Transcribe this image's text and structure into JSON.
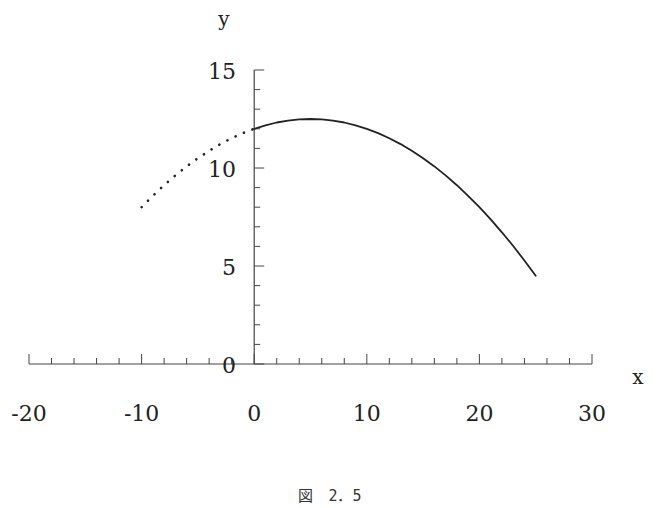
{
  "chart_data": {
    "type": "line",
    "title": "",
    "caption": "図　2．5",
    "xlabel": "x",
    "ylabel": "y",
    "xlim": [
      -20,
      30
    ],
    "ylim": [
      0,
      15
    ],
    "x_major_ticks": [
      -20,
      -10,
      0,
      10,
      20,
      30
    ],
    "x_tick_labels": [
      "-20",
      "-10",
      "0",
      "10",
      "20",
      "30"
    ],
    "x_minor_step": 2,
    "y_major_ticks": [
      0,
      5,
      10,
      15
    ],
    "y_tick_labels": [
      "0",
      "5",
      "10",
      "15"
    ],
    "y_minor_step": 1,
    "grid": false,
    "legend": "none",
    "series": [
      {
        "name": "dotted-extension",
        "style": "dotted",
        "color": "#222222",
        "x": [
          -10,
          -9,
          -8,
          -7,
          -6,
          -5,
          -4,
          -3,
          -2,
          -1,
          0
        ],
        "y": [
          8.0,
          8.58,
          9.12,
          9.62,
          10.08,
          10.5,
          10.88,
          11.22,
          11.52,
          11.78,
          12.0
        ]
      },
      {
        "name": "solid-curve",
        "style": "solid",
        "color": "#222222",
        "x": [
          0,
          1,
          2,
          3,
          4,
          5,
          6,
          7,
          8,
          9,
          10,
          11,
          12,
          13,
          14,
          15,
          16,
          17,
          18,
          19,
          20,
          21,
          22,
          23,
          24,
          25
        ],
        "y": [
          12.0,
          12.18,
          12.32,
          12.42,
          12.48,
          12.5,
          12.48,
          12.42,
          12.32,
          12.18,
          12.0,
          11.78,
          11.52,
          11.22,
          10.88,
          10.5,
          10.08,
          9.62,
          9.12,
          8.58,
          8.0,
          7.38,
          6.72,
          6.02,
          5.28,
          4.5
        ]
      }
    ]
  }
}
